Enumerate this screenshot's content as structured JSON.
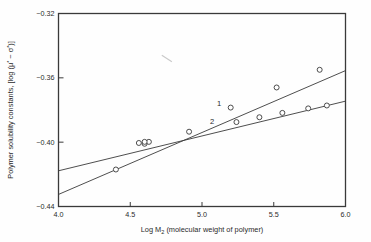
{
  "chart_data": {
    "type": "line",
    "title": "",
    "subtitle": "",
    "xlabel": "Log M₂ (molecular weight of polymer)",
    "xlabel_parts": {
      "prefix": "Log M",
      "sub": "2",
      "suffix": " (molecular weight of polymer)"
    },
    "ylabel": "Polymer solubility constants, [log (μ* − σ*)]",
    "ylabel_parts": {
      "lead": "Polymer solubility constants, [log (",
      "mu": "μ",
      "mu_sup": "*",
      "minus": " − ",
      "sigma": "σ",
      "sigma_sup": "*",
      "tail": ")]"
    },
    "xlim": [
      4.0,
      6.0
    ],
    "ylim": [
      -0.44,
      -0.32
    ],
    "xticks": [
      4.0,
      4.5,
      5.0,
      5.5,
      6.0
    ],
    "xtick_labels": [
      "4.0",
      "4.5",
      "5.0",
      "5.5",
      "6.0"
    ],
    "yticks": [
      -0.44,
      -0.4,
      -0.36,
      -0.32
    ],
    "ytick_labels": [
      "-0.44",
      "-0.40",
      "-0.36",
      "-0.32"
    ],
    "grid": false,
    "legend_position": "inline-annotations",
    "frame": "box",
    "tick_direction": "in",
    "marker": "open-circle",
    "line_color": "#3a3a3a",
    "marker_fill": "#ffffff",
    "axis_color": "#3a3a3a",
    "background": "#fefefe",
    "series": [
      {
        "name": "1",
        "label": "1",
        "label_x": 5.12,
        "label_y": -0.3775,
        "line_start": {
          "x": 4.0,
          "y": -0.4325
        },
        "line_end": {
          "x": 6.0,
          "y": -0.3555
        },
        "x": [
          4.4,
          4.6,
          4.63,
          5.2,
          5.52,
          5.82
        ],
        "y": [
          -0.417,
          -0.401,
          -0.3998,
          -0.3785,
          -0.366,
          -0.355
        ]
      },
      {
        "name": "2",
        "label": "2",
        "label_x": 5.07,
        "label_y": -0.3888,
        "line_start": {
          "x": 4.0,
          "y": -0.4178
        },
        "line_end": {
          "x": 6.0,
          "y": -0.3745
        },
        "x": [
          4.56,
          4.6,
          4.91,
          5.24,
          5.4,
          5.56,
          5.74,
          5.87
        ],
        "y": [
          -0.4005,
          -0.3998,
          -0.3935,
          -0.3875,
          -0.3845,
          -0.3818,
          -0.379,
          -0.3772
        ]
      }
    ],
    "annotations": [
      {
        "name": "stray-pencil-mark",
        "x1": 4.72,
        "y1": -0.346,
        "x2": 4.79,
        "y2": -0.35
      }
    ]
  }
}
